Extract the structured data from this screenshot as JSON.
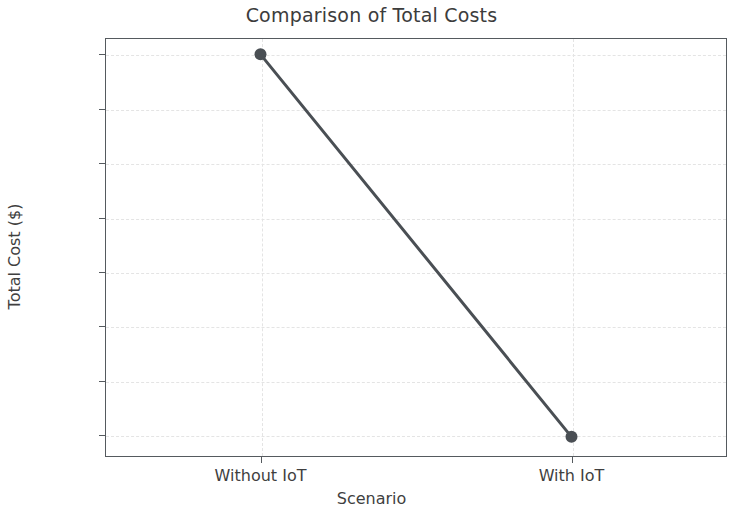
{
  "chart_data": {
    "type": "line",
    "title": "Comparison of Total Costs",
    "xlabel": "Scenario",
    "ylabel": "Total Cost ($)",
    "categories": [
      "Without IoT",
      "With IoT"
    ],
    "values": [
      50000,
      14850
    ],
    "series": [
      {
        "name": "Total Cost",
        "values": [
          50000,
          14850
        ],
        "color": "#4a4f54",
        "marker": "circle",
        "marker_size": 9,
        "line_width": 3
      }
    ],
    "ylim": [
      13000,
      51500
    ],
    "yticks": [
      15000,
      20000,
      25000,
      30000,
      35000,
      40000,
      45000,
      50000
    ],
    "ytick_labels": [
      "15000",
      "20000",
      "25000",
      "30000",
      "35000",
      "40000",
      "45000",
      "50000"
    ],
    "xtick_labels": [
      "Without IoT",
      "With IoT"
    ],
    "grid": true,
    "grid_style": "dashed",
    "grid_color": "#e4e4e4",
    "legend": "none",
    "background": "#ffffff",
    "axis_color": "#555a5e"
  }
}
